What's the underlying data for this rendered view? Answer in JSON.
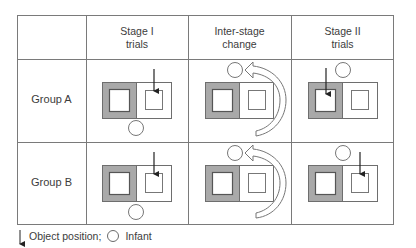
{
  "headers": {
    "stage1": [
      "Stage I",
      "trials"
    ],
    "inter": [
      "Inter-stage",
      "change"
    ],
    "stage2": [
      "Stage II",
      "trials"
    ]
  },
  "rows": [
    {
      "label": "Group A",
      "stage1": {
        "object_position": "right",
        "infant_position": "below"
      },
      "inter": {
        "infant_position": "above",
        "change": "rotate-clockwise-arrow"
      },
      "stage2": {
        "object_position": "left",
        "infant_position": "above"
      }
    },
    {
      "label": "Group B",
      "stage1": {
        "object_position": "right",
        "infant_position": "below"
      },
      "inter": {
        "infant_position": "above",
        "change": "rotate-clockwise-arrow"
      },
      "stage2": {
        "object_position": "right",
        "infant_position": "above"
      }
    }
  ],
  "legend": {
    "arrow_label": "Object position;",
    "circle_label": "Infant"
  },
  "colors": {
    "gray_fill": "#a9a9a9",
    "line": "#6e6e6e"
  }
}
